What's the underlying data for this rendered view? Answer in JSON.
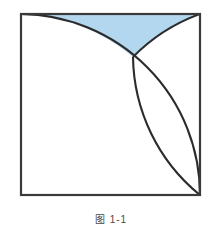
{
  "figure": {
    "caption": "图 1-1",
    "caption_visible_note": "caption is clipped by the bottom edge of the image",
    "background_color": "#ffffff",
    "square": {
      "label": "outer-square",
      "x": 21,
      "y": 14,
      "width": 179,
      "height": 181,
      "stroke_color": "#3a3a3a",
      "stroke_width": 2.2,
      "fill_color": "#ffffff"
    },
    "arcs": [
      {
        "name": "arc-from-top-left-to-bottom-right",
        "center_label": "bottom-left-corner",
        "start_point": "top-left-corner",
        "end_point": "bottom-right-corner",
        "radius": 180,
        "stroke_color": "#2b2b2b",
        "stroke_width": 2.0
      },
      {
        "name": "arc-from-top-right-to-bottom-right",
        "center_label": "top-right-region",
        "start_point": "top-right-corner",
        "end_point": "bottom-right-corner",
        "radius": 180,
        "stroke_color": "#2b2b2b",
        "stroke_width": 2.0
      }
    ],
    "shaded_regions": [
      {
        "name": "upper-lens-region",
        "description": "region bounded above by the top edge of the square and below by the two arcs",
        "fill_color": "#b2d7ee"
      },
      {
        "name": "central-lens-region",
        "description": "lens between the two arcs running from the arc intersection down to the bottom-right corner",
        "fill_color": "#b2d7ee"
      }
    ],
    "intersection_point": {
      "name": "arc-intersection",
      "x": 133,
      "y": 57
    },
    "colors": {
      "shade_blue": "#b2d7ee",
      "outline_dark": "#2b2b2b",
      "square_border": "#3a3a3a",
      "page_white": "#ffffff",
      "caption_gray": "#4a4a4a"
    }
  }
}
